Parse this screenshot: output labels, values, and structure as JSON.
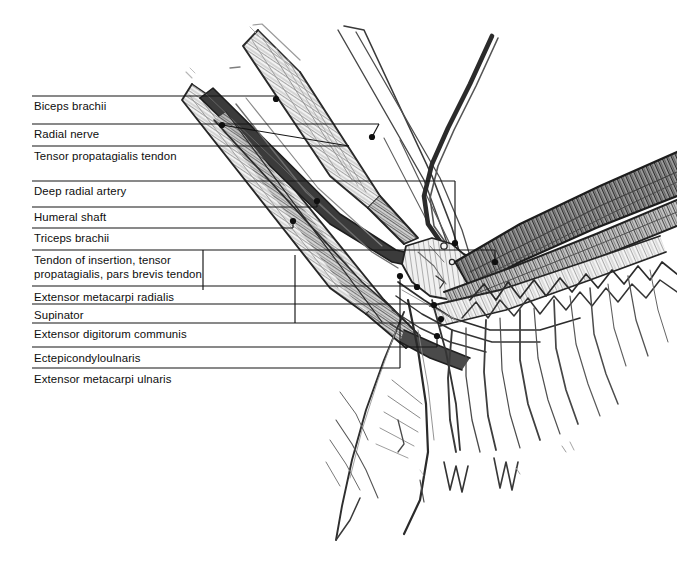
{
  "figure": {
    "width": 677,
    "height": 570,
    "background_color": "#ffffff",
    "ink_color": "#1a1a1a",
    "leader_color": "#141414"
  },
  "labels": [
    {
      "id": "biceps-brachii",
      "text": "Biceps brachii",
      "text_x": 34,
      "text_y": 100,
      "line_y": 96,
      "line_x1": 32,
      "line_x2": 276,
      "dot_x": 276,
      "dot_y": 99
    },
    {
      "id": "radial-nerve",
      "text": "Radial nerve",
      "text_x": 34,
      "text_y": 128,
      "line_y": 124,
      "line_x1": 32,
      "line_x2": 379,
      "dot_x": 372,
      "dot_y": 137
    },
    {
      "id": "tensor-propatagialis-tendon",
      "text": "Tensor propatagialis tendon",
      "text_x": 34,
      "text_y": 150,
      "line_y": 146,
      "line_x1": 32,
      "line_x2": 349,
      "dot_x": 222,
      "dot_y": 125
    },
    {
      "id": "deep-radial-artery",
      "text": "Deep radial artery",
      "text_x": 34,
      "text_y": 185,
      "line_y": 181,
      "line_x1": 32,
      "line_x2": 455,
      "dot_x": 455,
      "dot_y": 243
    },
    {
      "id": "humeral-shaft",
      "text": "Humeral shaft",
      "text_x": 34,
      "text_y": 211,
      "line_y": 207,
      "line_x1": 32,
      "line_x2": 317,
      "dot_x": 317,
      "dot_y": 201
    },
    {
      "id": "triceps-brachii",
      "text": "Triceps brachii",
      "text_x": 34,
      "text_y": 232,
      "line_y": 228,
      "line_x1": 32,
      "line_x2": 293,
      "dot_x": 293,
      "dot_y": 221
    },
    {
      "id": "tendon-of-insertion",
      "text": "Tendon of insertion, tensor\npropatagialis, pars brevis tendon",
      "text_x": 34,
      "text_y": 254,
      "line_y": 250,
      "line_x1": 32,
      "line_x2": 495,
      "dot_x": 495,
      "dot_y": 262
    },
    {
      "id": "extensor-metacarpi-radialis",
      "text": "Extensor metacarpi radialis",
      "text_x": 34,
      "text_y": 291,
      "line_y": 286,
      "line_x1": 32,
      "line_x2": 417,
      "dot_x": 417,
      "dot_y": 287
    },
    {
      "id": "supinator",
      "text": "Supinator",
      "text_x": 34,
      "text_y": 309,
      "line_y": 304,
      "line_x1": 32,
      "line_x2": 434,
      "dot_x": 434,
      "dot_y": 305
    },
    {
      "id": "extensor-digitorum-communis",
      "text": "Extensor digitorum communis",
      "text_x": 34,
      "text_y": 328,
      "line_y": 323,
      "line_x1": 32,
      "line_x2": 441,
      "dot_x": 441,
      "dot_y": 319
    },
    {
      "id": "ectepicondyloulnaris",
      "text": "Ectepicondyloulnaris",
      "text_x": 34,
      "text_y": 352,
      "line_y": 347,
      "line_x1": 32,
      "line_x2": 437,
      "dot_x": 437,
      "dot_y": 336
    },
    {
      "id": "extensor-metacarpi-ulnaris",
      "text": "Extensor metacarpi ulnaris",
      "text_x": 34,
      "text_y": 373,
      "line_y": 368,
      "line_x1": 32,
      "line_x2": 400,
      "dot_x": 400,
      "dot_y": 276
    }
  ],
  "elbow_leaders": [
    {
      "id": "elbow-leader-a",
      "from_x": 203,
      "from_y": 250,
      "corner_x": 203,
      "corner_y": 290,
      "to_x": 203,
      "to_y": 290
    },
    {
      "id": "elbow-leader-b",
      "from_x": 295,
      "from_y": 255,
      "corner_x": 295,
      "corner_y": 323,
      "to_x": 295,
      "to_y": 323
    }
  ]
}
